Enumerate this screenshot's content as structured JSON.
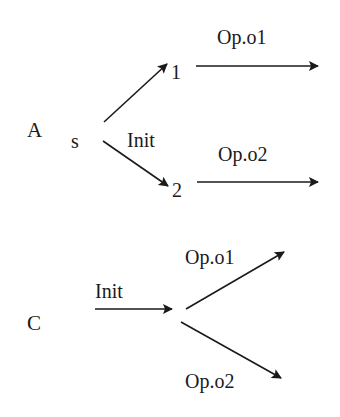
{
  "diagram": {
    "colors": {
      "ink": "#1a1a1a",
      "background": "#ffffff"
    },
    "panel_a": {
      "label": "A",
      "start_state": "s",
      "init_label": "Init",
      "nodes": [
        "1",
        "2"
      ],
      "edges": [
        {
          "from": "s",
          "to": "1",
          "label": ""
        },
        {
          "from": "s",
          "to": "2",
          "label": ""
        },
        {
          "from": "1",
          "to": "",
          "label": "Op.o1"
        },
        {
          "from": "2",
          "to": "",
          "label": "Op.o2"
        }
      ]
    },
    "panel_c": {
      "label": "C",
      "init_label": "Init",
      "edges": [
        {
          "from": "",
          "to": "branch",
          "label": "Init"
        },
        {
          "from": "branch",
          "to": "",
          "label": "Op.o1"
        },
        {
          "from": "branch",
          "to": "",
          "label": "Op.o2"
        }
      ]
    }
  }
}
